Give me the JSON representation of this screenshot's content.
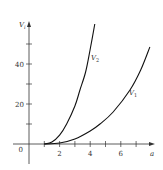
{
  "chart_data": {
    "type": "line",
    "title": "",
    "xlabel": "a",
    "ylabel": "V_i",
    "xlim": [
      0,
      8
    ],
    "ylim": [
      -8,
      62
    ],
    "x_ticks": [
      1,
      2,
      3,
      4,
      5,
      6,
      7
    ],
    "x_tick_labels": [
      "",
      "2",
      "",
      "4",
      "",
      "6",
      ""
    ],
    "y_ticks": [
      10,
      20,
      30,
      40,
      50
    ],
    "y_tick_labels": [
      "",
      "20",
      "",
      "40",
      ""
    ],
    "origin_label": "0",
    "grid": false,
    "series": [
      {
        "name": "V_2",
        "label_text": "V",
        "label_sub": "2",
        "x": [
          1,
          1.5,
          2,
          2.46,
          3,
          3.33,
          3.7,
          3.99,
          4.3
        ],
        "y": [
          0,
          1,
          4.4,
          10,
          19,
          27,
          36,
          47,
          60
        ]
      },
      {
        "name": "V_1",
        "label_text": "V",
        "label_sub": "1",
        "x": [
          1,
          2,
          3,
          4,
          4.64,
          5.5,
          6.6,
          7.3,
          7.9
        ],
        "y": [
          0,
          0.5,
          2.5,
          6.5,
          10,
          16,
          27,
          37,
          48.5
        ]
      }
    ]
  }
}
